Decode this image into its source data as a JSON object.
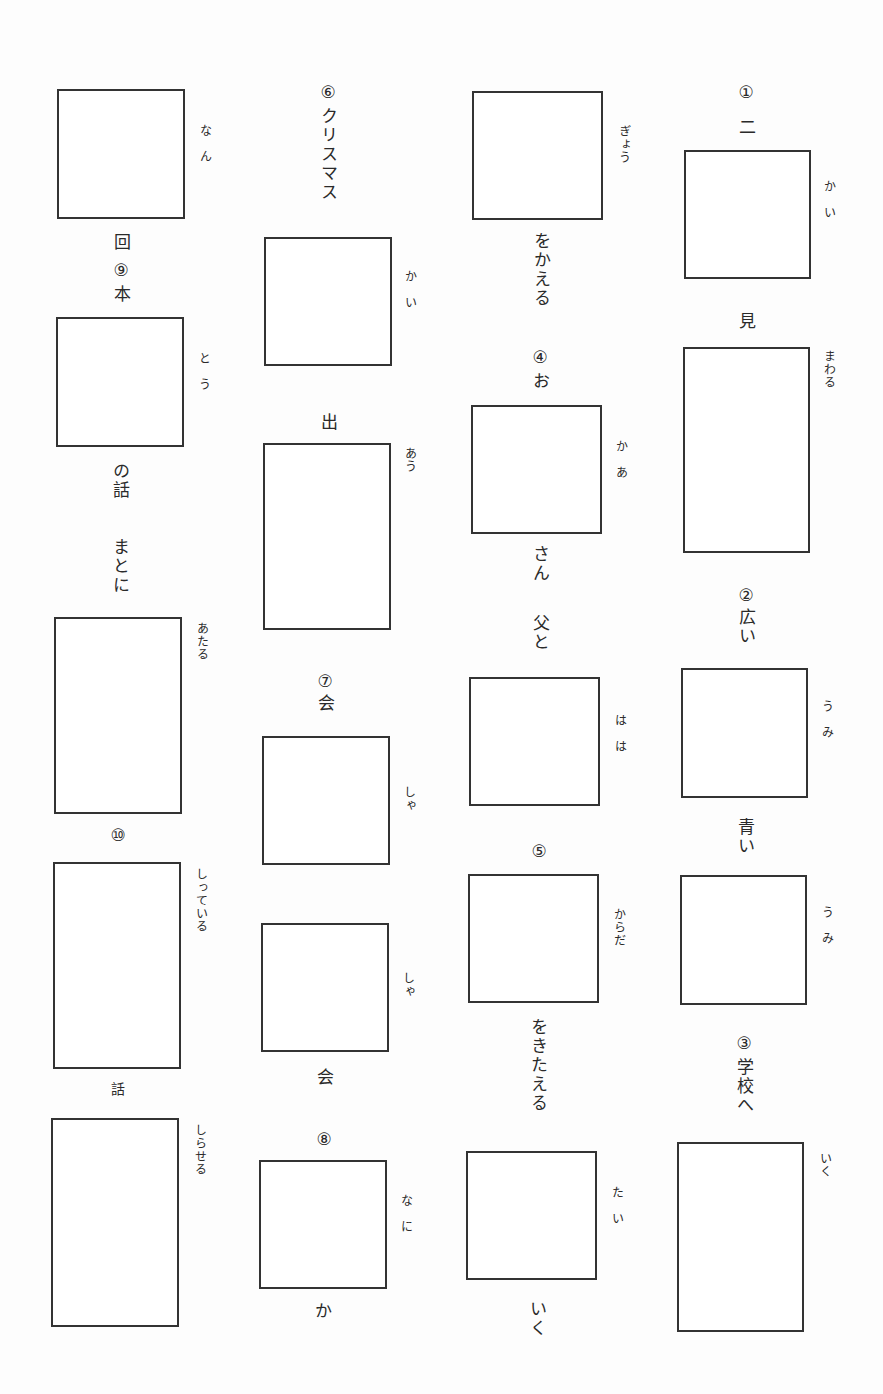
{
  "worksheet": {
    "title": "",
    "layout": "vertical-text kanji practice, 4 columns read right-to-left",
    "ink_color": "#333333",
    "paper_color": "#fdfdfd"
  },
  "questions": [
    {
      "number": "①",
      "items": [
        {
          "before": "二",
          "furigana": "かい",
          "after": ""
        },
        {
          "before": "見",
          "furigana": "まわる",
          "after": ""
        }
      ]
    },
    {
      "number": "②",
      "items": [
        {
          "before": "広い",
          "furigana": "うみ",
          "after": ""
        },
        {
          "before": "青い",
          "furigana": "うみ",
          "after": ""
        }
      ]
    },
    {
      "number": "③",
      "items": [
        {
          "before": "学校へ",
          "furigana": "いく",
          "after": ""
        }
      ]
    },
    {
      "number": "③-cont",
      "items": [
        {
          "before": "",
          "furigana": "ぎょう",
          "after": "をかえる"
        }
      ]
    },
    {
      "number": "④",
      "items": [
        {
          "before": "お",
          "furigana": "かあ",
          "after": "さん"
        },
        {
          "before": "父と",
          "furigana": "はは",
          "after": ""
        }
      ]
    },
    {
      "number": "⑤",
      "items": [
        {
          "before": "",
          "furigana": "からだ",
          "after": "をきたえる"
        },
        {
          "before": "",
          "furigana": "たい",
          "after": "いく"
        }
      ]
    },
    {
      "number": "⑥",
      "items": [
        {
          "before": "クリスマス",
          "furigana": "かい",
          "after": ""
        },
        {
          "before": "出",
          "furigana": "あう",
          "after": ""
        }
      ]
    },
    {
      "number": "⑦",
      "items": [
        {
          "before": "会",
          "furigana": "しゃ",
          "after": ""
        },
        {
          "before": "",
          "furigana": "しゃ",
          "after": "会"
        }
      ]
    },
    {
      "number": "⑧",
      "items": [
        {
          "before": "",
          "furigana": "なに",
          "after": "か"
        }
      ]
    },
    {
      "number": "⑧-cont",
      "items": [
        {
          "before": "",
          "furigana": "なん",
          "after": "回"
        }
      ]
    },
    {
      "number": "⑨",
      "items": [
        {
          "before": "本",
          "furigana": "とう",
          "after": "の話"
        },
        {
          "before": "まとに",
          "furigana": "あたる",
          "after": ""
        }
      ]
    },
    {
      "number": "⑩",
      "items": [
        {
          "before": "",
          "furigana": "しっている",
          "after": "話"
        },
        {
          "before": "",
          "furigana": "しらせる",
          "after": ""
        }
      ]
    }
  ],
  "labels": {
    "c4_num1": "①",
    "c4_t1": "二",
    "c4_f1": "かい",
    "c4_t2": "見",
    "c4_f2": "まわる",
    "c4_num2": "②",
    "c4_t3": "広い",
    "c4_f3": "うみ",
    "c4_t4": "青い",
    "c4_f4": "うみ",
    "c4_num3": "③",
    "c4_t5": "学校へ",
    "c4_f5": "いく",
    "c3_f1": "ぎょう",
    "c3_t1": "をかえる",
    "c3_num4": "④",
    "c3_t2": "お",
    "c3_f2": "かあ",
    "c3_t3": "さん",
    "c3_t4": "父と",
    "c3_f3": "はは",
    "c3_num5": "⑤",
    "c3_f4": "からだ",
    "c3_t5": "をきたえる",
    "c3_f5": "たい",
    "c3_t6": "いく",
    "c2_num6": "⑥",
    "c2_t1": "クリスマス",
    "c2_f1": "かい",
    "c2_t2": "出",
    "c2_f2": "あう",
    "c2_num7": "⑦",
    "c2_t3": "会",
    "c2_f3": "しゃ",
    "c2_f4": "しゃ",
    "c2_t4": "会",
    "c2_num8": "⑧",
    "c2_f5": "なに",
    "c2_t5": "か",
    "c1_f1": "なん",
    "c1_t1": "回",
    "c1_num9": "⑨",
    "c1_t2": "本",
    "c1_f2": "とう",
    "c1_t3": "の話",
    "c1_t4": "まとに",
    "c1_f3": "あたる",
    "c1_num10": "⑩",
    "c1_f4": "しっている",
    "c1_t5": "話",
    "c1_f5": "しらせる"
  }
}
